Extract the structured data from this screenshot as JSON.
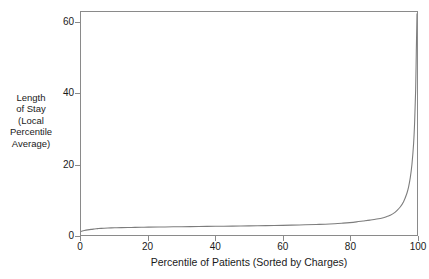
{
  "chart_data": {
    "type": "line",
    "title": "",
    "subtitle": "",
    "xlabel": "Percentile of Patients (Sorted by Charges)",
    "ylabel": "Length of Stay (Local Percentile Average)",
    "ylabel_lines": [
      "Length",
      "of Stay",
      "(Local",
      "Percentile",
      "Average)"
    ],
    "xlim": [
      0,
      100
    ],
    "ylim": [
      0,
      63
    ],
    "xticks": [
      0,
      20,
      40,
      60,
      80,
      100
    ],
    "xtick_labels": [
      "0",
      "20",
      "40",
      "60",
      "80",
      "100"
    ],
    "yticks": [
      0,
      20,
      40,
      60
    ],
    "ytick_labels": [
      "0",
      "20",
      "40",
      "60"
    ],
    "grid": false,
    "legend": false,
    "legend_position": "none",
    "line_color": "#7d7d7d",
    "frame_color": "#8a8a8a",
    "background": "#ffffff",
    "series": [
      {
        "name": "Length of Stay (Local Percentile Average)",
        "x": [
          0,
          1,
          2,
          3,
          4,
          5,
          6,
          8,
          10,
          12,
          15,
          18,
          20,
          25,
          30,
          35,
          40,
          45,
          50,
          55,
          60,
          65,
          70,
          74,
          78,
          80,
          82,
          84,
          86,
          88,
          90,
          91,
          92,
          93,
          94,
          95,
          96,
          97,
          97.5,
          98,
          98.5,
          99,
          99.3,
          99.6,
          99.8,
          100
        ],
        "values": [
          1.0,
          1.25,
          1.45,
          1.6,
          1.7,
          1.8,
          1.88,
          1.97,
          2.03,
          2.08,
          2.14,
          2.19,
          2.22,
          2.28,
          2.34,
          2.4,
          2.46,
          2.52,
          2.58,
          2.65,
          2.73,
          2.84,
          2.98,
          3.12,
          3.35,
          3.5,
          3.7,
          3.95,
          4.2,
          4.5,
          4.9,
          5.2,
          5.6,
          6.1,
          6.9,
          7.9,
          9.4,
          11.8,
          13.6,
          16.2,
          20.0,
          26.0,
          32.0,
          41.0,
          52.0,
          62.5
        ]
      }
    ]
  },
  "axes": {
    "y_label_block": "Length of Stay (Local Percentile Average)",
    "x_label_text": "Percentile of Patients (Sorted by Charges)"
  }
}
